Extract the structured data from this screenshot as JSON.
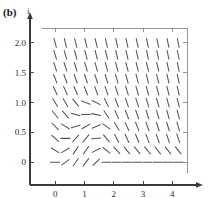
{
  "figure": {
    "panel_label": "(b)",
    "top_remnant": ". . . . .",
    "axes": {
      "x": {
        "label": "t",
        "ticks": [
          0,
          1,
          2,
          3,
          4
        ],
        "tick_labels": [
          "0",
          "1",
          "2",
          "3",
          "4"
        ],
        "range": [
          -0.45,
          4.5
        ],
        "arrow": true
      },
      "y": {
        "label": "i",
        "ticks": [
          0,
          0.5,
          1.0,
          1.5,
          2.0
        ],
        "tick_labels": [
          "0",
          "0.5",
          "1.0",
          "1.5",
          "2.0"
        ],
        "range": [
          -0.18,
          2.25
        ],
        "arrow": true
      }
    },
    "colors": {
      "axis": "#3a3a3a",
      "frame": "#7a7a7a",
      "marks": "#555555",
      "background": "#ffffff"
    }
  },
  "chart_data": {
    "type": "scatter",
    "plot_kind": "slope-field",
    "title": "",
    "xlabel": "t",
    "ylabel": "i",
    "xlim": [
      -0.45,
      4.5
    ],
    "ylim": [
      -0.18,
      2.25
    ],
    "grid": false,
    "legend": "none",
    "xticks": [
      0,
      1,
      2,
      3,
      4
    ],
    "yticks": [
      0,
      0.5,
      1.0,
      1.5,
      2.0
    ],
    "mark_length_px": 9,
    "grid_x": [
      0.0,
      0.35,
      0.7,
      1.05,
      1.4,
      1.75,
      2.1,
      2.45,
      2.8,
      3.15,
      3.5,
      3.85,
      4.2
    ],
    "grid_y": [
      0.0,
      0.2,
      0.4,
      0.6,
      0.8,
      1.0,
      1.2,
      1.4,
      1.6,
      1.8,
      2.0
    ],
    "slopes": [
      {
        "y": 2.0,
        "values": [
          -1.85,
          -1.9,
          -1.95,
          -2.0,
          -2.05,
          -2.1,
          -2.15,
          -2.2,
          -2.25,
          -2.3,
          -2.35,
          -2.4,
          -2.45
        ]
      },
      {
        "y": 1.8,
        "values": [
          -1.7,
          -1.75,
          -1.8,
          -1.85,
          -1.9,
          -1.95,
          -2.0,
          -2.05,
          -2.1,
          -2.2,
          -2.25,
          -2.3,
          -2.4
        ]
      },
      {
        "y": 1.6,
        "values": [
          -1.5,
          -1.55,
          -1.6,
          -1.65,
          -1.7,
          -1.8,
          -1.85,
          -1.9,
          -2.0,
          -2.05,
          -2.15,
          -2.2,
          -2.3
        ]
      },
      {
        "y": 1.4,
        "values": [
          -1.3,
          -1.35,
          -1.4,
          -1.45,
          -1.55,
          -1.6,
          -1.7,
          -1.75,
          -1.85,
          -1.95,
          -2.0,
          -2.1,
          -2.2
        ]
      },
      {
        "y": 1.2,
        "values": [
          -1.05,
          -1.1,
          -1.15,
          -1.25,
          -1.35,
          -1.45,
          -1.5,
          -1.6,
          -1.7,
          -1.8,
          -1.9,
          -2.0,
          -2.1
        ]
      },
      {
        "y": 1.0,
        "values": [
          -0.8,
          -0.85,
          -0.6,
          -0.2,
          -0.25,
          -1.0,
          -1.3,
          -1.45,
          -1.55,
          -1.65,
          -1.75,
          -1.85,
          -1.95
        ]
      },
      {
        "y": 0.8,
        "values": [
          -0.6,
          -0.55,
          -0.15,
          0.0,
          -0.1,
          -0.75,
          -1.1,
          -1.3,
          -1.4,
          -1.55,
          -1.65,
          -1.75,
          -1.85
        ]
      },
      {
        "y": 0.6,
        "values": [
          -0.5,
          -0.3,
          0.15,
          0.3,
          0.2,
          -0.35,
          -0.85,
          -1.1,
          -1.25,
          -1.4,
          -1.5,
          -1.6,
          -1.7
        ]
      },
      {
        "y": 0.4,
        "values": [
          -0.45,
          0.0,
          0.55,
          0.6,
          0.05,
          -0.6,
          -0.95,
          -1.1,
          -1.2,
          -1.3,
          -1.4,
          -1.45,
          -1.5
        ]
      },
      {
        "y": 0.2,
        "values": [
          -0.3,
          0.3,
          0.75,
          0.7,
          0.25,
          -0.4,
          -0.55,
          -0.6,
          -0.6,
          -0.62,
          -0.62,
          -0.62,
          -0.62
        ]
      },
      {
        "y": 0.0,
        "values": [
          0.0,
          0.35,
          0.7,
          0.65,
          0.5,
          0.0,
          0.0,
          0.0,
          0.0,
          0.0,
          0.0,
          0.0,
          0.0
        ]
      }
    ]
  }
}
